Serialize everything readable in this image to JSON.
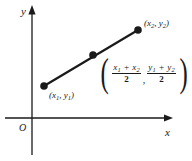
{
  "figure": {
    "type": "coordinate-plane-diagram",
    "background_color": "#ffffff",
    "ink_color": "#1a1a1a"
  },
  "axes": {
    "x_axis_label": "x",
    "y_axis_label": "y",
    "origin_label": "O",
    "x_axis": {
      "y": 118,
      "x_start": 5,
      "x_end": 172,
      "arrow": "right"
    },
    "y_axis": {
      "x": 32,
      "y_start": 6,
      "y_end": 155,
      "arrow": "up"
    }
  },
  "segment": {
    "endpoints": [
      {
        "px": 44,
        "py": 86,
        "label_x": "x",
        "label_sub_x": "1",
        "label_y": "y",
        "label_sub_y": "1"
      },
      {
        "px": 138,
        "py": 30,
        "label_x": "x",
        "label_sub_x": "2",
        "label_y": "y",
        "label_sub_y": "2"
      }
    ],
    "midpoint": {
      "px": 93,
      "py": 55
    },
    "point_radius": 3.6,
    "line_width": 2.2
  },
  "labels": {
    "point1": {
      "open": "(",
      "x": "x",
      "x_sub": "1",
      "comma": ", ",
      "y": "y",
      "y_sub": "1",
      "close": ")"
    },
    "point2": {
      "open": "(",
      "x": "x",
      "x_sub": "2",
      "comma": ", ",
      "y": "y",
      "y_sub": "2",
      "close": ")"
    }
  },
  "midpoint_formula": {
    "open_paren": "(",
    "close_paren": ")",
    "comma": ",",
    "x_numerator": {
      "a": "x",
      "a_sub": "1",
      "plus": " + ",
      "b": "x",
      "b_sub": "2"
    },
    "x_denominator": "2",
    "y_numerator": {
      "a": "y",
      "a_sub": "1",
      "plus": " + ",
      "b": "y",
      "b_sub": "2"
    },
    "y_denominator": "2"
  }
}
